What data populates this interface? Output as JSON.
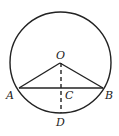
{
  "diagram": {
    "type": "geometry",
    "circle": {
      "center": "O",
      "cx": 60.5,
      "cy": 62.5,
      "r": 50.5
    },
    "points": {
      "O": {
        "label": "O",
        "x": 60,
        "y": 63
      },
      "A": {
        "label": "A",
        "x": 19,
        "y": 88
      },
      "B": {
        "label": "B",
        "x": 103,
        "y": 88
      },
      "C": {
        "label": "C",
        "x": 61,
        "y": 88
      },
      "D": {
        "label": "D",
        "x": 61,
        "y": 113
      }
    },
    "segments": [
      {
        "from": "O",
        "to": "A",
        "style": "solid"
      },
      {
        "from": "O",
        "to": "B",
        "style": "solid"
      },
      {
        "from": "A",
        "to": "B",
        "style": "solid"
      },
      {
        "from": "O",
        "to": "D",
        "style": "dashed"
      }
    ],
    "colors": {
      "stroke": "#222222",
      "background": "#ffffff"
    }
  }
}
